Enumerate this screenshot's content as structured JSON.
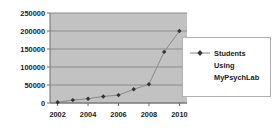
{
  "chart_data": {
    "type": "line",
    "title": "",
    "xlabel": "",
    "ylabel": "",
    "x": [
      2002,
      2003,
      2004,
      2005,
      2006,
      2007,
      2008,
      2009,
      2010
    ],
    "categories": [
      "2002",
      "2003",
      "2004",
      "2005",
      "2006",
      "2007",
      "2008",
      "2009",
      "2010"
    ],
    "series": [
      {
        "name": "Students Using MyPsychLab",
        "values": [
          2000,
          8000,
          12000,
          18000,
          22000,
          38000,
          52000,
          142000,
          200000
        ],
        "color": "#333333",
        "marker": "diamond"
      }
    ],
    "xlim": [
      2001.5,
      2010.5
    ],
    "ylim": [
      0,
      250000
    ],
    "ytick_values": [
      0,
      50000,
      100000,
      150000,
      200000,
      250000
    ],
    "ytick_labels": [
      "0",
      "50000",
      "100000",
      "150000",
      "200000",
      "250000"
    ],
    "xtick_values": [
      2002,
      2004,
      2006,
      2008,
      2010
    ],
    "xtick_labels": [
      "2002",
      "2004",
      "2006",
      "2008",
      "2010"
    ],
    "grid": {
      "horizontal": true,
      "vertical": false,
      "color": "#8c8c8c"
    },
    "plot_area_color": "#c2c2c2",
    "background_color": "#ffffff",
    "legend": {
      "position": "right",
      "border_color": "#b0b0b0",
      "background_color": "#ffffff",
      "entries": [
        {
          "label_lines": [
            "Students",
            "Using",
            "MyPsychLab"
          ],
          "marker": "diamond",
          "color": "#333333"
        }
      ]
    }
  }
}
